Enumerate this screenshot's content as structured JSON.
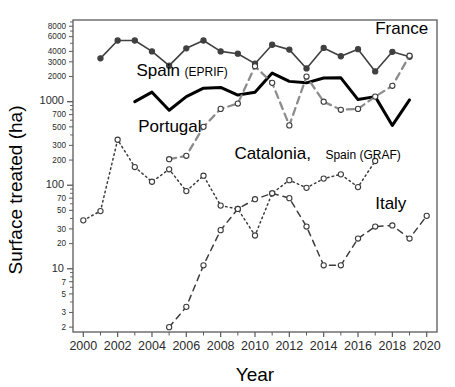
{
  "chart_data": {
    "type": "line",
    "title": "",
    "xlabel": "Year",
    "ylabel": "Surface treated (ha)",
    "xlim": [
      1999.4,
      2020.6
    ],
    "ylim": [
      1.75,
      9500
    ],
    "yscale": "log",
    "grid": false,
    "legend_position": "inline-annotations",
    "x_ticks": [
      2000,
      2002,
      2004,
      2006,
      2008,
      2010,
      2012,
      2014,
      2016,
      2018,
      2020
    ],
    "x_tick_labels": [
      "2000",
      "2002",
      "2004",
      "2006",
      "2008",
      "2010",
      "2012",
      "2014",
      "2016",
      "2018",
      "2020"
    ],
    "x_minor_ticks": [
      2001,
      2003,
      2005,
      2007,
      2009,
      2011,
      2013,
      2015,
      2017,
      2019
    ],
    "y_ticks": [
      2,
      3,
      5,
      7,
      10,
      20,
      30,
      50,
      70,
      100,
      200,
      300,
      500,
      700,
      1000,
      2000,
      3000,
      4000,
      6000,
      8000
    ],
    "y_tick_labels": [
      "2",
      "3",
      "5",
      "7",
      "10",
      "20",
      "30",
      "50",
      "70",
      "100",
      "200",
      "300",
      "500",
      "700",
      "1000",
      "2000",
      "3000",
      "4000",
      "6000",
      "8000"
    ],
    "y_major_ticks": [
      10,
      100,
      1000
    ],
    "series": [
      {
        "name": "France",
        "label": "France",
        "label_sub": "",
        "color": "#404040",
        "linestyle": "solid",
        "marker": "filled-circle",
        "label_x": 2017.0,
        "label_y": 6400,
        "x": [
          2001,
          2002,
          2003,
          2004,
          2005,
          2006,
          2007,
          2008,
          2009,
          2010,
          2011,
          2012,
          2013,
          2014,
          2015,
          2016,
          2017,
          2018,
          2019
        ],
        "values": [
          3300,
          5400,
          5400,
          4000,
          2700,
          4350,
          5400,
          4000,
          3750,
          2850,
          4800,
          4200,
          2500,
          4400,
          3500,
          4250,
          2300,
          3950,
          3450
        ]
      },
      {
        "name": "Spain (EPRIF)",
        "label": "Spain",
        "label_sub": "(EPRIF)",
        "color": "#000000",
        "linestyle": "solid-thick",
        "marker": "none",
        "label_x": 2003.1,
        "label_y": 2050,
        "x": [
          2003,
          2004,
          2005,
          2006,
          2007,
          2008,
          2009,
          2010,
          2011,
          2012,
          2013,
          2014,
          2015,
          2016,
          2017,
          2018,
          2019
        ],
        "values": [
          1000,
          1300,
          790,
          1150,
          1450,
          1480,
          1200,
          1300,
          2200,
          1750,
          1680,
          1920,
          1930,
          1060,
          1150,
          520,
          1050
        ]
      },
      {
        "name": "Portugal",
        "label": "Portugal",
        "label_sub": "",
        "color": "#8c8c8c",
        "linestyle": "dashed",
        "marker": "open-circle",
        "label_x": 2003.2,
        "label_y": 430,
        "x": [
          2005,
          2006,
          2007,
          2008,
          2009,
          2010,
          2011,
          2012,
          2013,
          2014,
          2015,
          2016,
          2017,
          2018,
          2019
        ],
        "values": [
          205,
          225,
          500,
          820,
          950,
          2650,
          1680,
          520,
          2000,
          1000,
          800,
          820,
          1150,
          1550,
          3550
        ]
      },
      {
        "name": "Catalonia, Spain (GRAF)",
        "label": "Catalonia,",
        "label_sub": "Spain (GRAF)",
        "color": "#3c3c3c",
        "linestyle": "dotted",
        "marker": "open-circle",
        "label_x": 2008.8,
        "label_y": 205,
        "x": [
          2000,
          2001,
          2002,
          2003,
          2004,
          2005,
          2006,
          2007,
          2008,
          2009,
          2010,
          2011,
          2012,
          2013,
          2014,
          2015,
          2016,
          2017
        ],
        "values": [
          38,
          49,
          350,
          165,
          110,
          155,
          85,
          130,
          57,
          52,
          25,
          80,
          115,
          93,
          120,
          135,
          95,
          195
        ]
      },
      {
        "name": "Italy",
        "label": "Italy",
        "label_sub": "",
        "color": "#3c3c3c",
        "linestyle": "long-dashed",
        "marker": "open-circle",
        "label_x": 2017.0,
        "label_y": 52,
        "x": [
          2005,
          2006,
          2007,
          2008,
          2009,
          2010,
          2011,
          2012,
          2013,
          2014,
          2015,
          2016,
          2017,
          2018,
          2019,
          2020
        ],
        "values": [
          2,
          3.5,
          11,
          29,
          52,
          68,
          80,
          70,
          32,
          11,
          11,
          23,
          32,
          33,
          23,
          43
        ]
      }
    ]
  }
}
